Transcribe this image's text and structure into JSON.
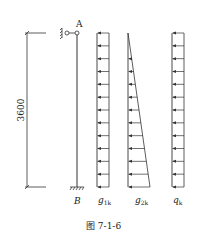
{
  "figure": {
    "caption": "图 7-1-6",
    "dimension_label": "3600",
    "top_node_label": "A",
    "bottom_node_label": "B",
    "load_cases": [
      {
        "symbol": "g",
        "subscript": "1k",
        "distribution": "uniform"
      },
      {
        "symbol": "g",
        "subscript": "2k",
        "distribution": "triangular-increasing-downward"
      },
      {
        "symbol": "q",
        "subscript": "k",
        "distribution": "uniform"
      }
    ],
    "arrow_direction": "left",
    "line_color": "#333333"
  }
}
